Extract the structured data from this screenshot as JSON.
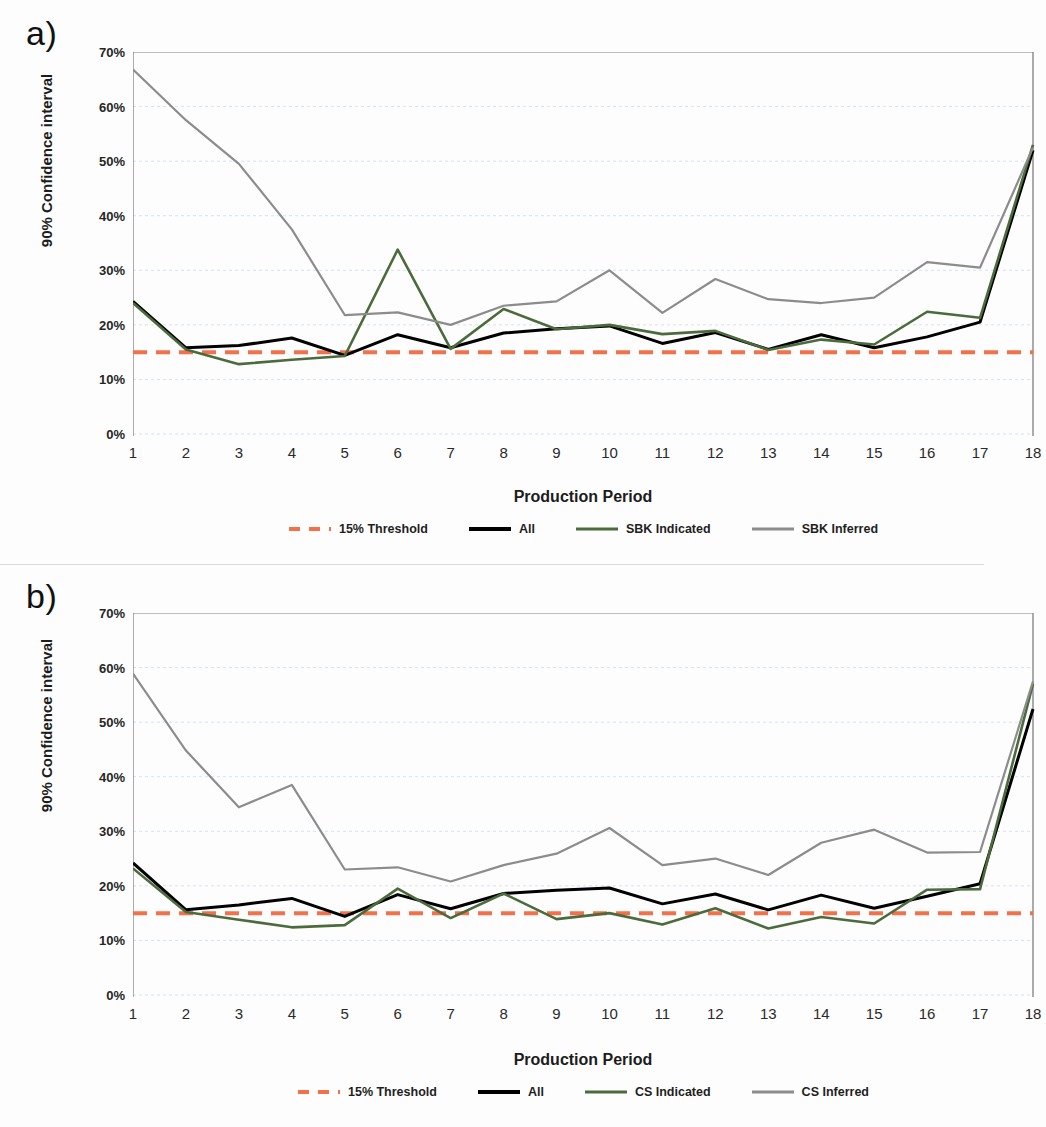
{
  "figure": {
    "background": "#fdfdfd",
    "separator_color": "#c9cfd6"
  },
  "colors": {
    "threshold": "#F2714A",
    "all": "#000000",
    "indicated": "#4C6B3C",
    "inferred": "#8C8C8C",
    "axis": "#808080",
    "gridline": "#d6e2ef",
    "text": "#1c1c1c"
  },
  "panels": [
    {
      "id": "a",
      "label": "a)",
      "chart_data": {
        "type": "line",
        "title": "",
        "xlabel": "Production Period",
        "ylabel": "90% Confidence interval",
        "xlim": [
          1,
          18
        ],
        "ylim": [
          0,
          70
        ],
        "grid": true,
        "legend_position": "bottom",
        "x": [
          1,
          2,
          3,
          4,
          5,
          6,
          7,
          8,
          9,
          10,
          11,
          12,
          13,
          14,
          15,
          16,
          17,
          18
        ],
        "xticklabels": [
          "1",
          "2",
          "3",
          "4",
          "5",
          "6",
          "7",
          "8",
          "9",
          "10",
          "11",
          "12",
          "13",
          "14",
          "15",
          "16",
          "17",
          "18"
        ],
        "yticklabels": [
          "0%",
          "10%",
          "20%",
          "30%",
          "40%",
          "50%",
          "60%",
          "70%"
        ],
        "ytickvalues": [
          0,
          10,
          20,
          30,
          40,
          50,
          60,
          70
        ],
        "series": [
          {
            "name": "15% Threshold",
            "color": "#F2714A",
            "style": "dashed",
            "width": 4,
            "constant": 15,
            "values": [
              15,
              15,
              15,
              15,
              15,
              15,
              15,
              15,
              15,
              15,
              15,
              15,
              15,
              15,
              15,
              15,
              15,
              15
            ]
          },
          {
            "name": "All",
            "color": "#000000",
            "style": "solid",
            "width": 3,
            "values": [
              24.3,
              15.8,
              16.2,
              17.6,
              14.4,
              18.2,
              15.8,
              18.5,
              19.3,
              19.8,
              16.6,
              18.6,
              15.5,
              18.2,
              15.8,
              17.8,
              20.5,
              52.0
            ]
          },
          {
            "name": "SBK Indicated",
            "color": "#4C6B3C",
            "style": "solid",
            "width": 2.6,
            "values": [
              24.0,
              15.5,
              12.8,
              13.6,
              14.3,
              33.8,
              15.6,
              22.9,
              19.2,
              20.0,
              18.3,
              18.9,
              15.4,
              17.3,
              16.4,
              22.4,
              21.3,
              53.0
            ]
          },
          {
            "name": "SBK Inferred",
            "color": "#8C8C8C",
            "style": "solid",
            "width": 2.2,
            "values": [
              66.8,
              57.5,
              49.5,
              37.5,
              21.8,
              22.3,
              20.0,
              23.5,
              24.3,
              30.0,
              22.2,
              28.4,
              24.7,
              24.0,
              25.0,
              31.5,
              30.5,
              52.5
            ]
          }
        ]
      },
      "legend": [
        {
          "label": "15% Threshold",
          "color": "#F2714A",
          "style": "dashed"
        },
        {
          "label": "All",
          "color": "#000000",
          "style": "solid"
        },
        {
          "label": "SBK Indicated",
          "color": "#4C6B3C",
          "style": "solid"
        },
        {
          "label": "SBK Inferred",
          "color": "#8C8C8C",
          "style": "solid"
        }
      ]
    },
    {
      "id": "b",
      "label": "b)",
      "chart_data": {
        "type": "line",
        "title": "",
        "xlabel": "Production Period",
        "ylabel": "90% Confidence interval",
        "xlim": [
          1,
          18
        ],
        "ylim": [
          0,
          70
        ],
        "grid": true,
        "legend_position": "bottom",
        "x": [
          1,
          2,
          3,
          4,
          5,
          6,
          7,
          8,
          9,
          10,
          11,
          12,
          13,
          14,
          15,
          16,
          17,
          18
        ],
        "xticklabels": [
          "1",
          "2",
          "3",
          "4",
          "5",
          "6",
          "7",
          "8",
          "9",
          "10",
          "11",
          "12",
          "13",
          "14",
          "15",
          "16",
          "17",
          "18"
        ],
        "yticklabels": [
          "0%",
          "10%",
          "20%",
          "30%",
          "40%",
          "50%",
          "60%",
          "70%"
        ],
        "ytickvalues": [
          0,
          10,
          20,
          30,
          40,
          50,
          60,
          70
        ],
        "series": [
          {
            "name": "15% Threshold",
            "color": "#F2714A",
            "style": "dashed",
            "width": 4,
            "constant": 15,
            "values": [
              15,
              15,
              15,
              15,
              15,
              15,
              15,
              15,
              15,
              15,
              15,
              15,
              15,
              15,
              15,
              15,
              15,
              15
            ]
          },
          {
            "name": "All",
            "color": "#000000",
            "style": "solid",
            "width": 3,
            "values": [
              24.2,
              15.6,
              16.5,
              17.7,
              14.4,
              18.4,
              15.8,
              18.6,
              19.2,
              19.6,
              16.7,
              18.5,
              15.6,
              18.3,
              15.9,
              18.1,
              20.4,
              52.4
            ]
          },
          {
            "name": "CS Indicated",
            "color": "#4C6B3C",
            "style": "solid",
            "width": 2.6,
            "values": [
              23.2,
              15.2,
              13.8,
              12.4,
              12.8,
              19.5,
              14.1,
              18.6,
              13.9,
              15.0,
              12.9,
              15.9,
              12.2,
              14.3,
              13.1,
              19.3,
              19.4,
              57.0
            ]
          },
          {
            "name": "CS Inferred",
            "color": "#8C8C8C",
            "style": "solid",
            "width": 2.2,
            "values": [
              58.9,
              44.8,
              34.4,
              38.5,
              23.0,
              23.4,
              20.8,
              23.8,
              25.9,
              30.6,
              23.8,
              25.0,
              22.0,
              27.9,
              30.3,
              26.1,
              26.2,
              57.5
            ]
          }
        ]
      },
      "legend": [
        {
          "label": "15% Threshold",
          "color": "#F2714A",
          "style": "dashed"
        },
        {
          "label": "All",
          "color": "#000000",
          "style": "solid"
        },
        {
          "label": "CS Indicated",
          "color": "#4C6B3C",
          "style": "solid"
        },
        {
          "label": "CS Inferred",
          "color": "#8C8C8C",
          "style": "solid"
        }
      ]
    }
  ]
}
